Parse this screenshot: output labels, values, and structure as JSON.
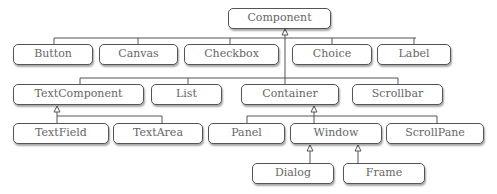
{
  "diagram": {
    "type": "class-hierarchy",
    "nodes": [
      {
        "id": "component",
        "label": "Component"
      },
      {
        "id": "button",
        "label": "Button"
      },
      {
        "id": "canvas",
        "label": "Canvas"
      },
      {
        "id": "checkbox",
        "label": "Checkbox"
      },
      {
        "id": "choice",
        "label": "Choice"
      },
      {
        "id": "label",
        "label": "Label"
      },
      {
        "id": "textcomponent",
        "label": "TextComponent"
      },
      {
        "id": "list",
        "label": "List"
      },
      {
        "id": "container",
        "label": "Container"
      },
      {
        "id": "scrollbar",
        "label": "Scrollbar"
      },
      {
        "id": "textfield",
        "label": "TextField"
      },
      {
        "id": "textarea",
        "label": "TextArea"
      },
      {
        "id": "panel",
        "label": "Panel"
      },
      {
        "id": "window",
        "label": "Window"
      },
      {
        "id": "scrollpane",
        "label": "ScrollPane"
      },
      {
        "id": "dialog",
        "label": "Dialog"
      },
      {
        "id": "frame",
        "label": "Frame"
      }
    ],
    "edges": [
      {
        "parent": "component",
        "children": [
          "button",
          "canvas",
          "checkbox",
          "choice",
          "label",
          "textcomponent",
          "list",
          "container",
          "scrollbar"
        ]
      },
      {
        "parent": "textcomponent",
        "children": [
          "textfield",
          "textarea"
        ]
      },
      {
        "parent": "container",
        "children": [
          "panel",
          "window",
          "scrollpane"
        ]
      },
      {
        "parent": "window",
        "children": [
          "dialog"
        ]
      },
      {
        "parent": "window",
        "children": [
          "frame"
        ]
      }
    ],
    "edge_style": "inheritance-hollow-triangle"
  }
}
